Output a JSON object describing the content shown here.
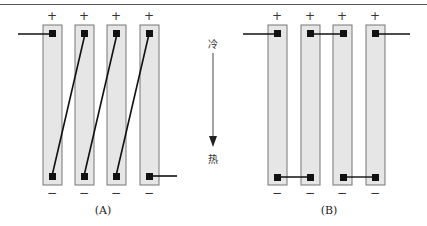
{
  "diagram": {
    "type": "thermoelectric-bar-wiring",
    "panels": [
      {
        "id": "A",
        "caption": "(A)",
        "bars": [
          {
            "top_sign": "+",
            "bottom_sign": "−"
          },
          {
            "top_sign": "+",
            "bottom_sign": "−"
          },
          {
            "top_sign": "+",
            "bottom_sign": "−"
          },
          {
            "top_sign": "+",
            "bottom_sign": "−"
          }
        ],
        "wiring": "series (diagonal: bottom of bar n to top of bar n+1)"
      },
      {
        "id": "B",
        "caption": "(B)",
        "bars": [
          {
            "top_sign": "+",
            "bottom_sign": "−"
          },
          {
            "top_sign": "+",
            "bottom_sign": "−"
          },
          {
            "top_sign": "+",
            "bottom_sign": "−"
          },
          {
            "top_sign": "+",
            "bottom_sign": "−"
          }
        ],
        "wiring": "top: lead-in to bar1, bar2–bar3 linked, bar4 lead-out; bottom: bar1–bar2 and bar3–bar4 linked"
      }
    ],
    "gradient_arrow": {
      "top_label": "冷",
      "bottom_label": "热",
      "direction": "down"
    },
    "colors": {
      "bar_fill": "#e6e6e6",
      "bar_border": "#777777",
      "node": "#111111",
      "wire": "#111111"
    }
  }
}
